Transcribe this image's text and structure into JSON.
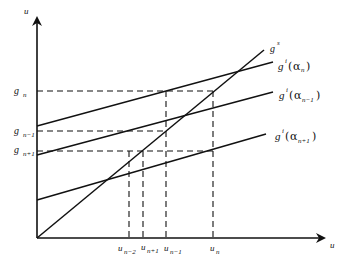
{
  "axes": {
    "y_label": "u",
    "x_label": "u"
  },
  "y_ticks": [
    {
      "base": "g",
      "sub": "n",
      "y": 91
    },
    {
      "base": "g",
      "sub": "n−1",
      "y": 131
    },
    {
      "base": "g",
      "sub": "n+1",
      "y": 151
    }
  ],
  "x_ticks": [
    {
      "base": "u",
      "sub": "n−2",
      "x": 129
    },
    {
      "base": "u",
      "sub": "n+1",
      "x": 143
    },
    {
      "base": "u",
      "sub": "n−1",
      "x": 166
    },
    {
      "base": "u",
      "sub": "n",
      "x": 213
    }
  ],
  "curves": [
    {
      "name": "g^s",
      "base": "g",
      "sup": "s",
      "arg": ""
    },
    {
      "name": "g^i(α_n)",
      "base": "g",
      "sup": "i",
      "arg": "α",
      "arg_sub": "n"
    },
    {
      "name": "g^i(α_{n−1})",
      "base": "g",
      "sup": "i",
      "arg": "α",
      "arg_sub": "n−1"
    },
    {
      "name": "g^i(α_{n+1})",
      "base": "g",
      "sup": "i",
      "arg": "α",
      "arg_sub": "n+1"
    }
  ]
}
